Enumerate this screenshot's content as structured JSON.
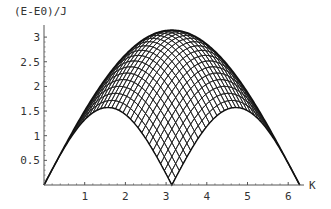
{
  "chart_data": {
    "type": "area",
    "title": "",
    "ylabel": "(E-E0)/J",
    "xlabel": "K",
    "xlim": [
      0,
      6.2832
    ],
    "ylim": [
      0,
      3.2
    ],
    "x_ticks": [
      "1",
      "2",
      "3",
      "4",
      "5",
      "6"
    ],
    "y_ticks": [
      "0.5",
      "1",
      "1.5",
      "2",
      "2.5",
      "3"
    ],
    "grid": false,
    "legend": null,
    "series": [
      {
        "name": "lower boundary (pi/2)|sin K|",
        "x": [
          0,
          0.5236,
          1.0472,
          1.5708,
          2.0944,
          2.618,
          3.1416,
          3.6652,
          4.1888,
          4.7124,
          5.236,
          5.7596,
          6.2832
        ],
        "values": [
          0,
          0.785,
          1.36,
          1.571,
          1.36,
          0.785,
          0,
          0.785,
          1.36,
          1.571,
          1.36,
          0.785,
          0
        ]
      },
      {
        "name": "upper boundary pi|sin(K/2)|",
        "x": [
          0,
          0.5236,
          1.0472,
          1.5708,
          2.0944,
          2.618,
          3.1416,
          3.6652,
          4.1888,
          4.7124,
          5.236,
          5.7596,
          6.2832
        ],
        "values": [
          0,
          0.813,
          1.571,
          2.221,
          2.721,
          3.035,
          3.142,
          3.035,
          2.721,
          2.221,
          1.571,
          0.813,
          0
        ]
      }
    ],
    "fill": "dense crosshatch mesh between lower and upper boundaries"
  },
  "axes": {
    "ylabel": "(E-E0)/J",
    "xlabel": "K",
    "x_tick_labels": [
      "1",
      "2",
      "3",
      "4",
      "5",
      "6"
    ],
    "y_tick_labels": [
      "0.5",
      "1",
      "1.5",
      "2",
      "2.5",
      "3"
    ]
  }
}
